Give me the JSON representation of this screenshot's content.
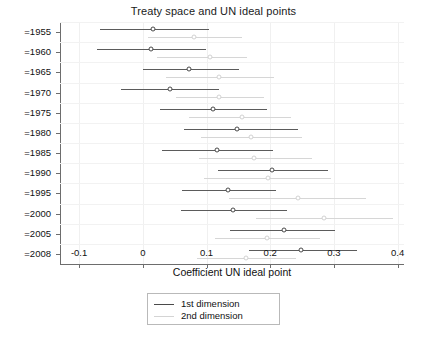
{
  "chart_data": {
    "type": "scatter",
    "title": "Treaty space and UN ideal points",
    "xlabel": "Coefficient UN ideal point",
    "ylabel": "",
    "xlim": [
      -0.13,
      0.41
    ],
    "xticks": [
      -0.1,
      0,
      0.1,
      0.2,
      0.3,
      0.4
    ],
    "xtick_labels": [
      "-0.1",
      "0",
      "0.1",
      "0.2",
      "0.3",
      "0.4"
    ],
    "categories": [
      "=1955",
      "=1960",
      "=1965",
      "=1970",
      "=1975",
      "=1980",
      "=1985",
      "=1990",
      "=1995",
      "=2000",
      "=2005",
      "=2008"
    ],
    "grid": true,
    "legend_position": "below-axis-center",
    "series": [
      {
        "name": "1st dimension",
        "color": "#5b5b5b",
        "estimates": [
          0.016,
          0.013,
          0.073,
          0.042,
          0.11,
          0.148,
          0.117,
          0.203,
          0.133,
          0.141,
          0.222,
          0.249
        ],
        "ci_low": [
          -0.067,
          -0.072,
          0.0,
          -0.034,
          0.027,
          0.065,
          0.03,
          0.118,
          0.062,
          0.06,
          0.137,
          0.166
        ],
        "ci_high": [
          0.104,
          0.099,
          0.151,
          0.119,
          0.195,
          0.244,
          0.204,
          0.291,
          0.209,
          0.227,
          0.302,
          0.337
        ]
      },
      {
        "name": "2nd dimension",
        "color": "#d6d6d6",
        "estimates": [
          0.08,
          0.105,
          0.12,
          0.12,
          0.155,
          0.17,
          0.175,
          0.196,
          0.243,
          0.285,
          0.195,
          0.162
        ],
        "ci_low": [
          0.008,
          0.022,
          0.036,
          0.052,
          0.072,
          0.092,
          0.088,
          0.096,
          0.135,
          0.177,
          0.113,
          0.085
        ],
        "ci_high": [
          0.155,
          0.163,
          0.206,
          0.19,
          0.232,
          0.25,
          0.265,
          0.295,
          0.35,
          0.393,
          0.278,
          0.24
        ]
      }
    ]
  },
  "legend": {
    "items": [
      {
        "label": "1st dimension"
      },
      {
        "label": "2nd dimension"
      }
    ]
  }
}
